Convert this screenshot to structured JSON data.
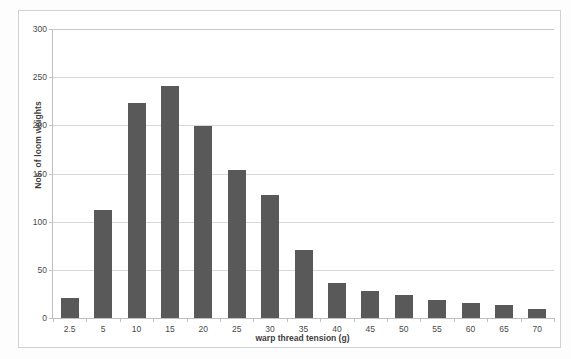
{
  "chart_data": {
    "type": "bar",
    "title": "",
    "xlabel": "warp thread tension (g)",
    "ylabel": "Nos. of loom weights",
    "categories": [
      "2.5",
      "5",
      "10",
      "15",
      "20",
      "25",
      "30",
      "35",
      "40",
      "45",
      "50",
      "55",
      "60",
      "65",
      "70"
    ],
    "values": [
      21,
      112,
      223,
      241,
      199,
      154,
      128,
      71,
      36,
      28,
      24,
      19,
      16,
      13,
      9
    ],
    "ylim": [
      0,
      300
    ],
    "yticks": [
      "0",
      "50",
      "100",
      "150",
      "200",
      "250",
      "300"
    ],
    "ytick_values": [
      0,
      50,
      100,
      150,
      200,
      250,
      300
    ],
    "grid": "horizontal",
    "legend": "none",
    "bar_color": "#595959",
    "gridline_color": "#d9d9d9",
    "axis_color": "#bfbfbf",
    "background_color": "#ffffff"
  }
}
